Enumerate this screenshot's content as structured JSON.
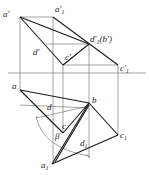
{
  "labels": {
    "a_prime": "a′",
    "a1_prime": "a′",
    "a1_prime_sub": "1",
    "d1_prime_b_prime": "d′",
    "d1_prime_sub": "1",
    "d1_prime_b_suffix": "(b′)",
    "d_prime": "d′",
    "c_prime": "c′",
    "c1_prime": "c′",
    "c1_prime_sub": "1",
    "a": "a",
    "b": "b",
    "d": "d",
    "c": "c",
    "c1": "c",
    "c1_sub": "1",
    "beta": "β",
    "d1": "d",
    "d1_sub": "1",
    "a1": "a",
    "a1_sub": "1"
  },
  "colors": {
    "thick": "#1a1a1a",
    "thin": "#555555",
    "background": "#ffffff"
  }
}
